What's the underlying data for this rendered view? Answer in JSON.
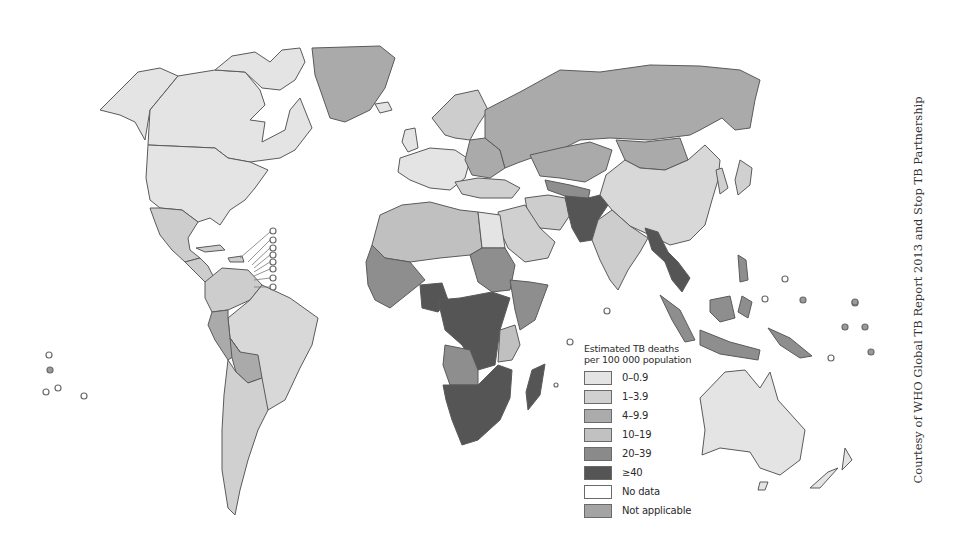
{
  "map": {
    "title": "Estimated TB deaths per 100 000 population",
    "colors": {
      "c0": "#e4e4e4",
      "c1": "#cdcdcd",
      "c2": "#a9a9a9",
      "c3": "#bdbdbd",
      "c4": "#8a8a8a",
      "c5": "#555555",
      "nodata": "#ffffff",
      "na": "#a4a4a4"
    }
  },
  "legend": {
    "title_line1": "Estimated TB deaths",
    "title_line2": "per 100 000 population",
    "items": [
      {
        "label": "0–0.9",
        "color": "#e4e4e4"
      },
      {
        "label": "1–3.9",
        "color": "#d0d0d0"
      },
      {
        "label": "4–9.9",
        "color": "#ababab"
      },
      {
        "label": "10–19",
        "color": "#c1c1c1"
      },
      {
        "label": "20–39",
        "color": "#8a8a8a"
      },
      {
        "label": "≥40",
        "color": "#555555"
      },
      {
        "label": "No data",
        "color": "#ffffff"
      },
      {
        "label": "Not applicable",
        "color": "#a4a4a4"
      }
    ]
  },
  "credit": "Courtesy of WHO Global TB Report 2013 and Stop TB Partnership"
}
